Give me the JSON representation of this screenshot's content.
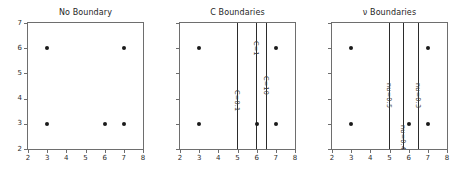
{
  "figure": {
    "width": 452,
    "height": 178,
    "background": "#ffffff",
    "line_color": "#2b2b2b",
    "point_color": "#1a1a1a",
    "axis_color": "#6e6e6e"
  },
  "chart_data": [
    {
      "type": "scatter",
      "title": "No Boundary",
      "xlabel": "",
      "ylabel": "",
      "xlim": [
        2,
        8
      ],
      "ylim": [
        2,
        7
      ],
      "xticks": [
        2,
        3,
        4,
        5,
        6,
        7,
        8
      ],
      "yticks": [
        2,
        3,
        4,
        5,
        6,
        7
      ],
      "xticklabels": [
        "2",
        "3",
        "4",
        "5",
        "6",
        "7",
        "8"
      ],
      "yticklabels": [
        "2",
        "3",
        "4",
        "5",
        "6",
        "7"
      ],
      "grid": false,
      "legend": "none",
      "points": [
        {
          "x": 3,
          "y": 6
        },
        {
          "x": 7,
          "y": 6
        },
        {
          "x": 3,
          "y": 3
        },
        {
          "x": 6,
          "y": 3
        },
        {
          "x": 7,
          "y": 3
        }
      ],
      "vlines": []
    },
    {
      "type": "scatter",
      "title": "C Boundaries",
      "xlabel": "",
      "ylabel": "",
      "xlim": [
        2,
        8
      ],
      "ylim": [
        2,
        7
      ],
      "xticks": [
        2,
        3,
        4,
        5,
        6,
        7,
        8
      ],
      "yticks": [
        2,
        3,
        4,
        5,
        6,
        7
      ],
      "xticklabels": [
        "2",
        "3",
        "4",
        "5",
        "6",
        "7",
        "8"
      ],
      "yticklabels": [
        "2",
        "3",
        "4",
        "5",
        "6",
        "7"
      ],
      "grid": false,
      "legend": "none",
      "points": [
        {
          "x": 3,
          "y": 6
        },
        {
          "x": 7,
          "y": 6
        },
        {
          "x": 3,
          "y": 3
        },
        {
          "x": 6,
          "y": 3
        },
        {
          "x": 7,
          "y": 3
        }
      ],
      "vlines": [
        {
          "x": 5.0,
          "label": "C=0.1",
          "label_y": 4.35
        },
        {
          "x": 6.0,
          "label": "C=1",
          "label_y": 6.3
        },
        {
          "x": 6.5,
          "label": "C=10",
          "label_y": 4.9
        }
      ]
    },
    {
      "type": "scatter",
      "title": "ν Boundaries",
      "xlabel": "",
      "ylabel": "",
      "xlim": [
        2,
        8
      ],
      "ylim": [
        2,
        7
      ],
      "xticks": [
        2,
        3,
        4,
        5,
        6,
        7,
        8
      ],
      "yticks": [
        2,
        3,
        4,
        5,
        6,
        7
      ],
      "xticklabels": [
        "2",
        "3",
        "4",
        "5",
        "6",
        "7",
        "8"
      ],
      "yticklabels": [
        "2",
        "3",
        "4",
        "5",
        "6",
        "7"
      ],
      "grid": false,
      "legend": "none",
      "points": [
        {
          "x": 3,
          "y": 6
        },
        {
          "x": 7,
          "y": 6
        },
        {
          "x": 3,
          "y": 3
        },
        {
          "x": 6,
          "y": 3
        },
        {
          "x": 7,
          "y": 3
        }
      ],
      "vlines": [
        {
          "x": 5.0,
          "label": "nu=0.5",
          "label_y": 4.6
        },
        {
          "x": 5.75,
          "label": "nu=0.4",
          "label_y": 2.95
        },
        {
          "x": 6.5,
          "label": "nu=0.3",
          "label_y": 4.6
        }
      ]
    }
  ],
  "panels_geometry": [
    {
      "left": 23,
      "plot_left": 27,
      "plot_top": 22,
      "plot_width": 117,
      "plot_height": 128
    },
    {
      "left": 175,
      "plot_left": 179,
      "plot_top": 22,
      "plot_width": 117,
      "plot_height": 128
    },
    {
      "left": 327,
      "plot_left": 331,
      "plot_top": 22,
      "plot_width": 117,
      "plot_height": 128
    }
  ]
}
